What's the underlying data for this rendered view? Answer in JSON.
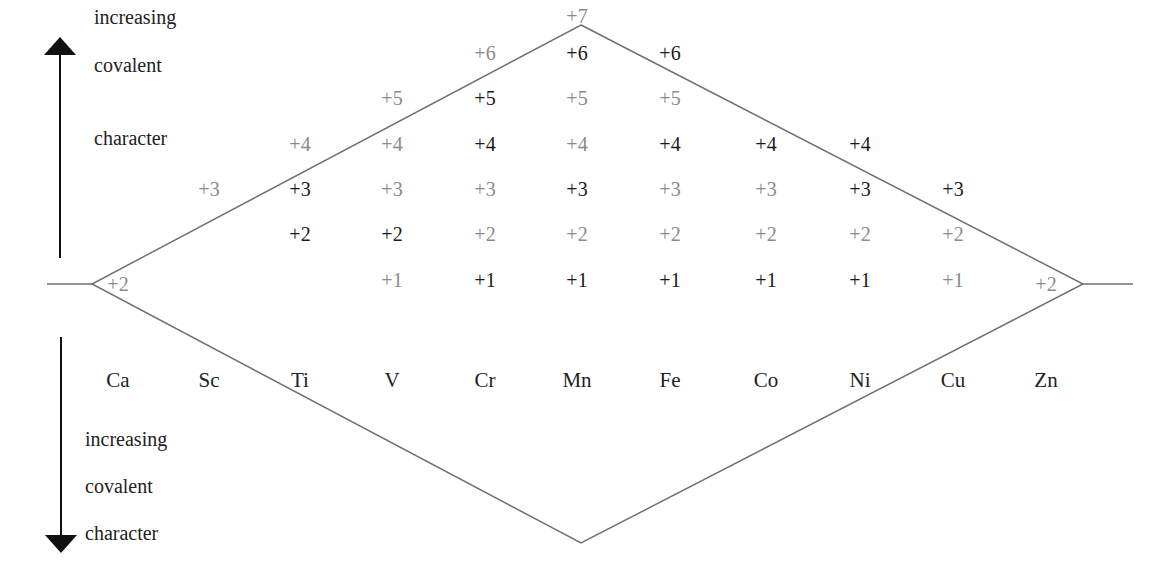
{
  "diagram": {
    "title_top_arrow": [
      "increasing",
      "covalent",
      "character"
    ],
    "title_bottom_arrow": [
      "increasing",
      "covalent",
      "character"
    ],
    "colors": {
      "line": "#707070",
      "dark_text": "#1a1a1a",
      "light_text": "#8a8a8a",
      "arrow": "#111111"
    },
    "elements": [
      "Ca",
      "Sc",
      "Ti",
      "V",
      "Cr",
      "Mn",
      "Fe",
      "Co",
      "Ni",
      "Cu",
      "Zn"
    ],
    "oxidation_states": {
      "Ca": [
        {
          "v": "+2",
          "tone": "light"
        }
      ],
      "Sc": [
        {
          "v": "+3",
          "tone": "light"
        }
      ],
      "Ti": [
        {
          "v": "+4",
          "tone": "light"
        },
        {
          "v": "+3",
          "tone": "dark"
        },
        {
          "v": "+2",
          "tone": "dark"
        }
      ],
      "V": [
        {
          "v": "+5",
          "tone": "light"
        },
        {
          "v": "+4",
          "tone": "light"
        },
        {
          "v": "+3",
          "tone": "light"
        },
        {
          "v": "+2",
          "tone": "dark"
        },
        {
          "v": "+1",
          "tone": "light"
        }
      ],
      "Cr": [
        {
          "v": "+6",
          "tone": "light"
        },
        {
          "v": "+5",
          "tone": "dark"
        },
        {
          "v": "+4",
          "tone": "dark"
        },
        {
          "v": "+3",
          "tone": "light"
        },
        {
          "v": "+2",
          "tone": "light"
        },
        {
          "v": "+1",
          "tone": "dark"
        }
      ],
      "Mn": [
        {
          "v": "+7",
          "tone": "light"
        },
        {
          "v": "+6",
          "tone": "dark"
        },
        {
          "v": "+5",
          "tone": "light"
        },
        {
          "v": "+4",
          "tone": "light"
        },
        {
          "v": "+3",
          "tone": "dark"
        },
        {
          "v": "+2",
          "tone": "light"
        },
        {
          "v": "+1",
          "tone": "dark"
        }
      ],
      "Fe": [
        {
          "v": "+6",
          "tone": "dark"
        },
        {
          "v": "+5",
          "tone": "light"
        },
        {
          "v": "+4",
          "tone": "dark"
        },
        {
          "v": "+3",
          "tone": "light"
        },
        {
          "v": "+2",
          "tone": "light"
        },
        {
          "v": "+1",
          "tone": "dark"
        }
      ],
      "Co": [
        {
          "v": "+4",
          "tone": "dark"
        },
        {
          "v": "+3",
          "tone": "light"
        },
        {
          "v": "+2",
          "tone": "light"
        },
        {
          "v": "+1",
          "tone": "dark"
        }
      ],
      "Ni": [
        {
          "v": "+4",
          "tone": "dark"
        },
        {
          "v": "+3",
          "tone": "dark"
        },
        {
          "v": "+2",
          "tone": "light"
        },
        {
          "v": "+1",
          "tone": "dark"
        }
      ],
      "Cu": [
        {
          "v": "+3",
          "tone": "dark"
        },
        {
          "v": "+2",
          "tone": "light"
        },
        {
          "v": "+1",
          "tone": "light"
        }
      ],
      "Zn": [
        {
          "v": "+2",
          "tone": "light"
        }
      ]
    }
  }
}
